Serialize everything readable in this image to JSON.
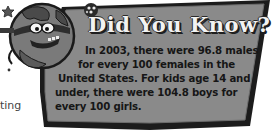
{
  "callout": {
    "title": "Did You Know?",
    "lines": [
      "In 2003, there were 96.8 males",
      "for every 100 females in the",
      "United States. For kids age 14 and",
      "under, there were 104.8 boys for",
      "every 100 girls."
    ]
  },
  "fragment": {
    "left_text": "ting"
  },
  "mascot": {
    "icon": "globe-character-icon"
  },
  "colors": {
    "box_fill": "#8a8a8a",
    "box_border": "#1c1c1c",
    "title_fill": "#f2f2f2",
    "text": "#161616"
  }
}
